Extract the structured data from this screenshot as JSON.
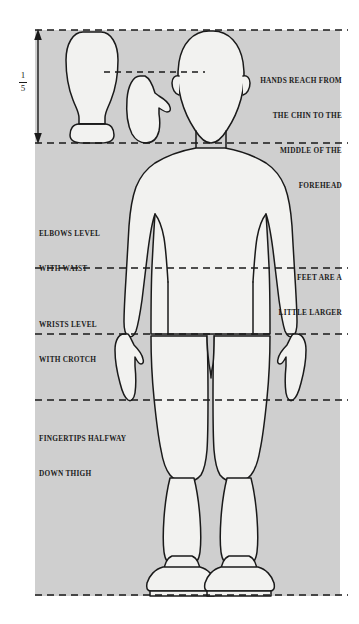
{
  "figure": {
    "panel": {
      "fill": "#cfcfcf",
      "x": 35,
      "y": 30,
      "width": 305,
      "height": 566
    },
    "body_fill": "#f2f2f0",
    "line_color": "#1a1a1a"
  },
  "scale_marker": {
    "name": "one-fifth-head-height",
    "numerator": "1",
    "denominator": "5",
    "arrow_top_y": 30,
    "arrow_bottom_y": 143
  },
  "annotations": {
    "right": {
      "line1": "HANDS REACH FROM",
      "line2": "THE CHIN TO THE",
      "line3": "MIDDLE OF THE",
      "line4": "FOREHEAD",
      "line5": "FEET ARE A",
      "line6": "LITTLE LARGER"
    },
    "elbows": {
      "line1": "ELBOWS LEVEL",
      "line2": "WITH WAIST"
    },
    "wrists": {
      "line1": "WRISTS LEVEL",
      "line2": "WITH CROTCH"
    },
    "fingertips": {
      "line1": "FINGERTIPS HALFWAY",
      "line2": "DOWN THIGH"
    }
  },
  "guide_lines": [
    {
      "name": "top-of-head",
      "y": 30,
      "x1": 35,
      "x2": 348,
      "style": "dashed"
    },
    {
      "name": "middle-of-forehead",
      "y": 72,
      "x1": 104,
      "x2": 205,
      "style": "dashed"
    },
    {
      "name": "chin-and-shoulders",
      "y": 143,
      "x1": 35,
      "x2": 348,
      "style": "dashed"
    },
    {
      "name": "elbows-and-waist",
      "y": 268,
      "x1": 35,
      "x2": 348,
      "style": "dashed"
    },
    {
      "name": "wrists-and-crotch",
      "y": 334,
      "x1": 35,
      "x2": 348,
      "style": "dashed"
    },
    {
      "name": "fingertips-mid-thigh",
      "y": 400,
      "x1": 35,
      "x2": 348,
      "style": "dashed"
    },
    {
      "name": "ground-line",
      "y": 595,
      "x1": 35,
      "x2": 348,
      "style": "dashed"
    }
  ],
  "shapes": {
    "shoe_sole": "shoe-sole-outline",
    "hand": "hand-outline",
    "figure": "standing-human-figure-rear-view"
  }
}
